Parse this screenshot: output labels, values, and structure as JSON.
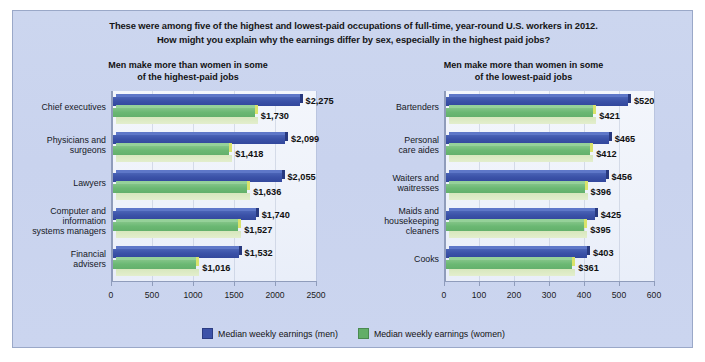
{
  "caption": {
    "line1": "These were among five of the highest and lowest-paid occupations of full-time, year-round U.S. workers in 2012.",
    "line2": "How might you explain why the earnings differ by sex, especially in the highest paid jobs?"
  },
  "legend": {
    "men_label": "Median weekly earnings (men)",
    "women_label": "Median weekly earnings (women)",
    "men_color": "#3c52a8",
    "women_color": "#62ae68"
  },
  "panels": {
    "left": {
      "title_line1": "Men make more than women in some",
      "title_line2": "of the highest-paid jobs"
    },
    "right": {
      "title_line1": "Men make more than women in some",
      "title_line2": "of the lowest-paid jobs"
    }
  },
  "chart_data": [
    {
      "type": "bar",
      "orientation": "horizontal",
      "title": "Men make more than women in some of the highest-paid jobs",
      "xlabel": "",
      "ylabel": "",
      "xlim": [
        0,
        2500
      ],
      "xticks": [
        0,
        500,
        1000,
        1500,
        2000,
        2500
      ],
      "xticklabels": [
        "0",
        "500",
        "1000",
        "1500",
        "2000",
        "2500"
      ],
      "grid": true,
      "legend_position": "bottom",
      "categories": [
        "Chief executives",
        "Physicians and surgeons",
        "Lawyers",
        "Computer and information systems managers",
        "Financial advisers"
      ],
      "category_lines": [
        [
          "Chief executives"
        ],
        [
          "Physicians and",
          "surgeons"
        ],
        [
          "Lawyers"
        ],
        [
          "Computer and",
          "information",
          "systems managers"
        ],
        [
          "Financial",
          "advisers"
        ]
      ],
      "series": [
        {
          "name": "Median weekly earnings (men)",
          "color": "#3c52a8",
          "values": [
            2275,
            2099,
            2055,
            1740,
            1532
          ],
          "labels": [
            "$2,275",
            "$2,099",
            "$2,055",
            "$1,740",
            "$1,532"
          ]
        },
        {
          "name": "Median weekly earnings (women)",
          "color": "#62ae68",
          "values": [
            1730,
            1418,
            1636,
            1527,
            1016
          ],
          "labels": [
            "$1,730",
            "$1,418",
            "$1,636",
            "$1,527",
            "$1,016"
          ]
        }
      ]
    },
    {
      "type": "bar",
      "orientation": "horizontal",
      "title": "Men make more than women in some of the lowest-paid jobs",
      "xlabel": "",
      "ylabel": "",
      "xlim": [
        0,
        600
      ],
      "xticks": [
        0,
        100,
        200,
        300,
        400,
        500,
        600
      ],
      "xticklabels": [
        "0",
        "100",
        "200",
        "300",
        "400",
        "500",
        "600"
      ],
      "grid": true,
      "legend_position": "bottom",
      "categories": [
        "Bartenders",
        "Personal care aides",
        "Waiters and waitresses",
        "Maids and housekeeping cleaners",
        "Cooks"
      ],
      "category_lines": [
        [
          "Bartenders"
        ],
        [
          "Personal",
          "care aides"
        ],
        [
          "Waiters and",
          "waitresses"
        ],
        [
          "Maids and",
          "housekeeping",
          "cleaners"
        ],
        [
          "Cooks"
        ]
      ],
      "series": [
        {
          "name": "Median weekly earnings (men)",
          "color": "#3c52a8",
          "values": [
            520,
            465,
            456,
            425,
            403
          ],
          "labels": [
            "$520",
            "$465",
            "$456",
            "$425",
            "$403"
          ]
        },
        {
          "name": "Median weekly earnings (women)",
          "color": "#62ae68",
          "values": [
            421,
            412,
            396,
            395,
            361
          ],
          "labels": [
            "$421",
            "$412",
            "$396",
            "$395",
            "$361"
          ]
        }
      ]
    }
  ]
}
